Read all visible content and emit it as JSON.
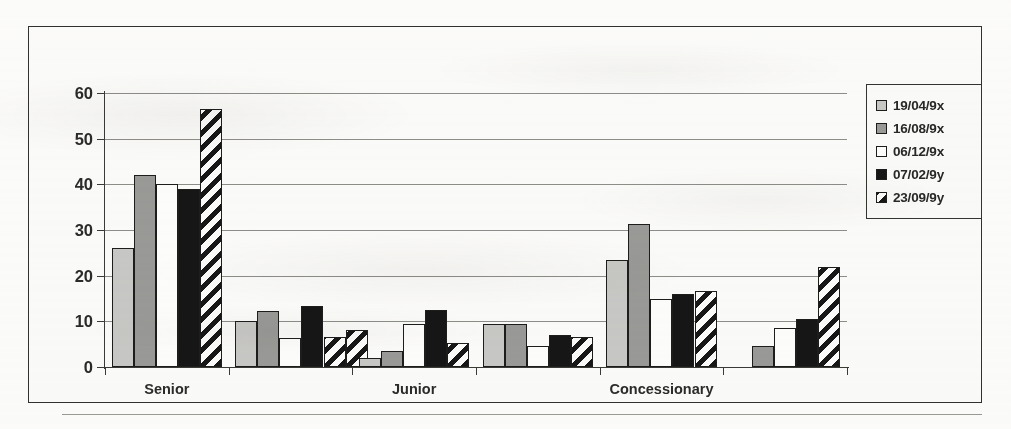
{
  "chart_data": {
    "type": "bar",
    "title": "",
    "xlabel": "",
    "ylabel": "",
    "ylim": [
      0,
      60
    ],
    "yticks": [
      0,
      10,
      20,
      30,
      40,
      50,
      60
    ],
    "grid": true,
    "legend_position": "right",
    "categories": [
      "Senior",
      "",
      "Junior",
      "",
      "Concessionary",
      ""
    ],
    "tick_labels": [
      "Senior",
      "Junior",
      "Concessionary"
    ],
    "series": [
      {
        "name": "19/04/9x",
        "swatch": "light-gray",
        "color": "#c9c9c7",
        "values": [
          26,
          10,
          2,
          9.5,
          23.5,
          0
        ]
      },
      {
        "name": "16/08/9x",
        "swatch": "mid-gray",
        "color": "#9a9a98",
        "values": [
          42,
          12.2,
          3.4,
          9.5,
          31.3,
          4.5
        ]
      },
      {
        "name": "06/12/9x",
        "swatch": "white",
        "color": "#fefefe",
        "values": [
          40,
          6.3,
          9.4,
          4.5,
          15,
          8.5
        ]
      },
      {
        "name": "07/02/9y",
        "swatch": "black",
        "color": "#161616",
        "values": [
          39,
          13.3,
          12.5,
          7,
          16,
          10.5
        ]
      },
      {
        "name": "23/09/9y",
        "swatch": "diagonal-stripe",
        "color": "#171717",
        "values": [
          56.5,
          6.5,
          5.3,
          6.5,
          16.7,
          22
        ]
      }
    ],
    "group_extra_values": [
      [],
      [
        8.1
      ],
      [],
      [],
      [],
      []
    ]
  },
  "legend": {
    "items": [
      {
        "label": "19/04/9x",
        "swatch": "light-gray"
      },
      {
        "label": "16/08/9x",
        "swatch": "mid-gray"
      },
      {
        "label": "06/12/9x",
        "swatch": "white"
      },
      {
        "label": "07/02/9y",
        "swatch": "black"
      },
      {
        "label": "23/09/9y",
        "swatch": "diagonal-stripe"
      }
    ]
  },
  "axis": {
    "y_tick_labels": [
      "0",
      "10",
      "20",
      "30",
      "40",
      "50",
      "60"
    ],
    "x_tick_labels": [
      "Senior",
      "Junior",
      "Concessionary"
    ]
  }
}
